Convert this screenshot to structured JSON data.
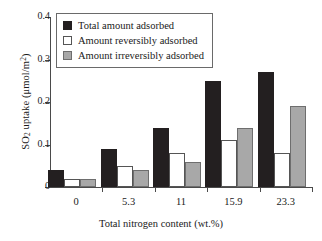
{
  "chart_data": {
    "type": "bar",
    "title": "",
    "xlabel": "Total nitrogen content (wt.%)",
    "ylabel": "SO2 uptake (μmol/m2)",
    "ylabel_parts": {
      "pre": "SO",
      "sub": "2",
      "mid": " uptake (μmol/m",
      "sup": "2",
      "post": ")"
    },
    "categories": [
      "0",
      "5.3",
      "11",
      "15.9",
      "23.3"
    ],
    "ylim": [
      0,
      0.4
    ],
    "yticks": [
      "0",
      "0.1",
      "0.2",
      "0.3",
      "0.4"
    ],
    "ytick_values": [
      0,
      0.1,
      0.2,
      0.3,
      0.4
    ],
    "grid": false,
    "legend_position": "top-left",
    "series": [
      {
        "name": "Total amount adsorbed",
        "color": "#231f20",
        "values": [
          0.04,
          0.09,
          0.14,
          0.25,
          0.27
        ]
      },
      {
        "name": "Amount reversibly adsorbed",
        "color": "#ffffff",
        "values": [
          0.02,
          0.05,
          0.08,
          0.11,
          0.08
        ]
      },
      {
        "name": "Amount irreversibly adsorbed",
        "color": "#a8a8a8",
        "values": [
          0.02,
          0.04,
          0.06,
          0.14,
          0.19
        ]
      }
    ]
  },
  "legend": {
    "items": [
      {
        "label": "Total amount adsorbed",
        "swatch": "black"
      },
      {
        "label": "Amount reversibly adsorbed",
        "swatch": "white"
      },
      {
        "label": "Amount irreversibly adsorbed",
        "swatch": "gray"
      }
    ]
  }
}
